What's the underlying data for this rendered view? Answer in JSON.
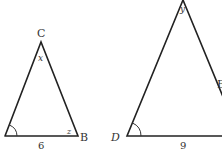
{
  "colors": {
    "line": "#222222",
    "text": "#333333",
    "background": "#ffffff"
  },
  "triangle_abc": {
    "vertices": {
      "A": "A",
      "B": "B",
      "C": "C"
    },
    "angle_labels": {
      "at_C": "x",
      "at_B": "z"
    },
    "side_labels": {
      "AB": "6"
    },
    "marked_angle": "A"
  },
  "triangle_def": {
    "vertices": {
      "D": "D",
      "E": "E"
    },
    "angle_labels": {
      "at_apex": "y"
    },
    "side_labels": {
      "DF": "9"
    },
    "marked_angle": "D"
  }
}
